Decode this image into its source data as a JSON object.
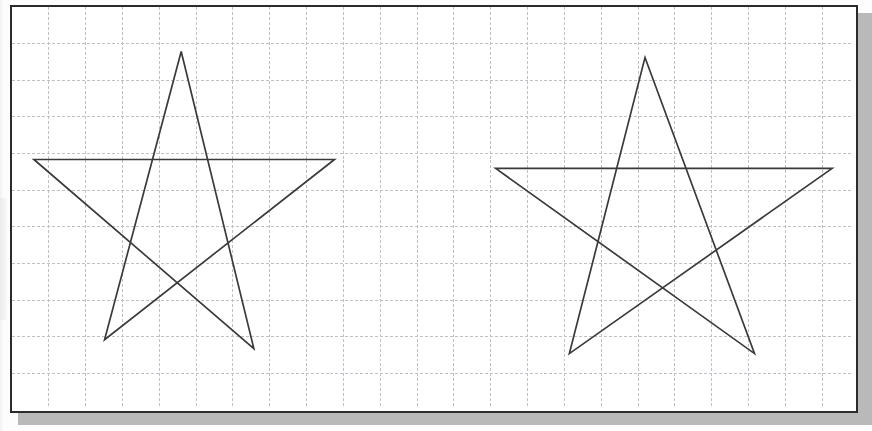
{
  "document": {
    "kind": "scanned-worksheet",
    "background_color": "#fdfdfd",
    "page_width": 872,
    "page_height": 431
  },
  "figure": {
    "name": "two-stars-on-grid",
    "frame": {
      "x": 10,
      "y": 5,
      "width": 848,
      "height": 408,
      "border_color": "#2b2b2b",
      "border_width": 2,
      "fill_color": "#ffffff"
    },
    "shadow": {
      "offset_x": 8,
      "offset_y": 8,
      "color": "#b9b9b9"
    },
    "grid": {
      "cell_size": 37,
      "line_color": "#bfbfc6",
      "line_style": "dashed",
      "columns": 23,
      "rows": 11,
      "visible": true
    }
  },
  "shapes": [
    {
      "name": "star-left",
      "label": "five-pointed star",
      "type": "pentagram",
      "stroke_color": "#3a3a3a",
      "stroke_width": 1.7,
      "center": {
        "x": 185,
        "y": 203
      },
      "points": [
        {
          "x": 182,
          "y": 52
        },
        {
          "x": 255,
          "y": 352
        },
        {
          "x": 34,
          "y": 161
        },
        {
          "x": 336,
          "y": 161
        },
        {
          "x": 105,
          "y": 343
        }
      ]
    },
    {
      "name": "star-right",
      "label": "five-pointed star",
      "type": "pentagram",
      "stroke_color": "#3a3a3a",
      "stroke_width": 1.7,
      "center": {
        "x": 662,
        "y": 212
      },
      "points": [
        {
          "x": 648,
          "y": 58
        },
        {
          "x": 758,
          "y": 357
        },
        {
          "x": 498,
          "y": 170
        },
        {
          "x": 836,
          "y": 170
        },
        {
          "x": 572,
          "y": 357
        }
      ]
    }
  ]
}
